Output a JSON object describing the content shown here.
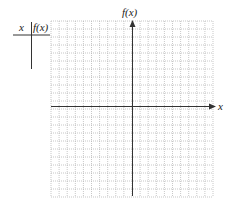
{
  "table": {
    "header_x": "x",
    "header_fx": "f(x)",
    "rows": []
  },
  "graph": {
    "x_axis_label": "x",
    "y_axis_label": "f(x)",
    "grid": {
      "columns": 20,
      "rows": 22,
      "line_style": "dotted",
      "grid_color": "#b0b0b0",
      "axis_color": "#333333"
    }
  }
}
